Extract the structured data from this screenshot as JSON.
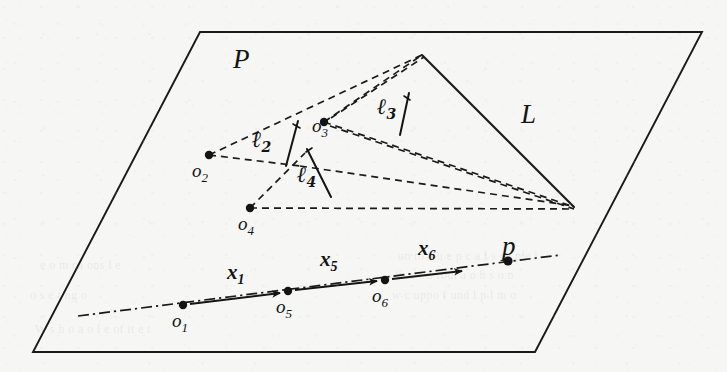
{
  "figure": {
    "kind": "geometric-diagram",
    "caption_free": true,
    "background_color": "#f6f6f4",
    "ink_color": "#141414"
  },
  "labels": {
    "plane": "P",
    "line_L": "L",
    "point_p": "p"
  },
  "origins": [
    {
      "id": "o1",
      "base": "o",
      "sub": "1",
      "x": 183,
      "y": 305,
      "label_x": 172,
      "label_y": 311
    },
    {
      "id": "o2",
      "base": "o",
      "sub": "2",
      "x": 209,
      "y": 155,
      "label_x": 192,
      "label_y": 161
    },
    {
      "id": "o3",
      "base": "o",
      "sub": "3",
      "x": 324,
      "y": 122,
      "label_x": 312,
      "label_y": 116
    },
    {
      "id": "o4",
      "base": "o",
      "sub": "4",
      "x": 250,
      "y": 208,
      "label_x": 238,
      "label_y": 214
    },
    {
      "id": "o5",
      "base": "o",
      "sub": "5",
      "x": 288,
      "y": 291,
      "label_x": 276,
      "label_y": 297
    },
    {
      "id": "o6",
      "base": "o",
      "sub": "6",
      "x": 385,
      "y": 280,
      "label_x": 372,
      "label_y": 286
    }
  ],
  "ell_labels": [
    {
      "id": "l2",
      "base": "ℓ",
      "sub": "2",
      "label_x": 252,
      "label_y": 128
    },
    {
      "id": "l3",
      "base": "ℓ",
      "sub": "3",
      "label_x": 377,
      "label_y": 95
    },
    {
      "id": "l4",
      "base": "ℓ",
      "sub": "4",
      "label_x": 297,
      "label_y": 163
    }
  ],
  "vectors": [
    {
      "id": "x1",
      "base": "x",
      "sub": "1",
      "label_x": 227,
      "label_y": 262,
      "from_x": 190,
      "from_y": 304,
      "to_x": 280,
      "to_y": 293
    },
    {
      "id": "x5",
      "base": "x",
      "sub": "5",
      "label_x": 320,
      "label_y": 249,
      "from_x": 295,
      "from_y": 290,
      "to_x": 377,
      "to_y": 281
    },
    {
      "id": "x6",
      "base": "x",
      "sub": "6",
      "label_x": 418,
      "label_y": 238,
      "from_x": 392,
      "from_y": 279,
      "to_x": 462,
      "to_y": 271
    }
  ],
  "plane_polygon": "200,32 702,32 535,352 33,352",
  "triangle_apex": {
    "x": 422,
    "y": 55
  },
  "triangle_right_vertex": {
    "x": 574,
    "y": 207
  },
  "label_positions": {
    "plane_x": 233,
    "plane_y": 46,
    "line_L_x": 521,
    "line_L_y": 101,
    "point_p_x": 502,
    "point_p_y": 233
  },
  "ghost_lines": [
    {
      "text": "on  to  c  u  e  p   c  a  l  s  co  ple  l",
      "x": 398,
      "y": 249,
      "size": 12
    },
    {
      "text": "th  a  e   o    rom  a  o     h  s   o  n",
      "x": 395,
      "y": 268,
      "size": 12
    },
    {
      "text": "w  c  uppo   f  und  l  p   l  m  o",
      "x": 392,
      "y": 288,
      "size": 12
    },
    {
      "text": "e  o  m    ca      ons   l  e",
      "x": 40,
      "y": 258,
      "size": 12
    },
    {
      "text": "o  s    e  t  ng  o",
      "x": 30,
      "y": 288,
      "size": 12
    },
    {
      "text": "W    s   h     o   a  o      l  e  of  it  e  t",
      "x": 35,
      "y": 322,
      "size": 12
    }
  ]
}
